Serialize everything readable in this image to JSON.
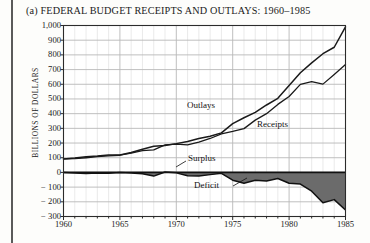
{
  "figure": {
    "label": "(a)",
    "title": "(a) FEDERAL BUDGET RECEIPTS AND OUTLAYS: 1960–1985"
  },
  "chart_data": {
    "type": "line",
    "title": "(a) FEDERAL BUDGET RECEIPTS AND OUTLAYS: 1960–1985",
    "xlabel": "",
    "ylabel": "BILLIONS OF DOLLARS",
    "xlim": [
      1960,
      1985
    ],
    "ylim": [
      -300,
      1000
    ],
    "ytick_step": 100,
    "xtick_step": 5,
    "xtick_minor_step": 1,
    "grid": true,
    "legend_position": "inline-annotations",
    "ytick_labels": [
      "1,000",
      "900",
      "800",
      "700",
      "600",
      "500",
      "400",
      "300",
      "200",
      "100",
      "0",
      "− 100",
      "− 200",
      "− 300"
    ],
    "ytick_values": [
      1000,
      900,
      800,
      700,
      600,
      500,
      400,
      300,
      200,
      100,
      0,
      -100,
      -200,
      -300
    ],
    "xtick_labels": [
      "1960",
      "1965",
      "1970",
      "1975",
      "1980",
      "1985"
    ],
    "xtick_values": [
      1960,
      1965,
      1970,
      1975,
      1980,
      1985
    ],
    "x": [
      1960,
      1961,
      1962,
      1963,
      1964,
      1965,
      1966,
      1967,
      1968,
      1969,
      1970,
      1971,
      1972,
      1973,
      1974,
      1975,
      1976,
      1977,
      1978,
      1979,
      1980,
      1981,
      1982,
      1983,
      1984,
      1985
    ],
    "series": [
      {
        "name": "Outlays",
        "label": "Outlays",
        "color": "#1a1a1a",
        "values": [
          92,
          98,
          107,
          111,
          119,
          118,
          135,
          158,
          178,
          184,
          196,
          210,
          231,
          246,
          269,
          332,
          372,
          409,
          459,
          504,
          591,
          678,
          746,
          808,
          852,
          990
        ]
      },
      {
        "name": "Receipts",
        "label": "Receipts",
        "color": "#1a1a1a",
        "values": [
          92,
          94,
          100,
          107,
          113,
          117,
          131,
          149,
          153,
          187,
          193,
          187,
          207,
          231,
          263,
          279,
          298,
          356,
          400,
          463,
          517,
          599,
          618,
          601,
          667,
          734
        ]
      }
    ],
    "annotations": [
      {
        "name": "Surplus",
        "label": "Surplus"
      },
      {
        "name": "Deficit",
        "label": "Deficit"
      }
    ],
    "area_fill": {
      "name": "deficit-area",
      "color": "#6b6b6b",
      "description": "shaded band between receipts and outlays difference at baseline"
    }
  }
}
